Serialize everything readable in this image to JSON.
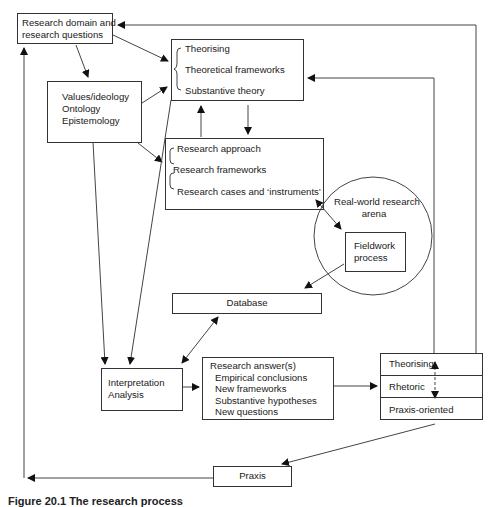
{
  "diagram": {
    "nodes": {
      "research_domain": {
        "lines": [
          "Research domain and",
          "research questions"
        ]
      },
      "values": {
        "lines": [
          "Values/ideology",
          "Ontology",
          "Epistemology"
        ]
      },
      "theory": {
        "lines": [
          "Theorising",
          "Theoretical frameworks",
          "Substantive theory"
        ]
      },
      "approach": {
        "lines": [
          "Research approach",
          "Research frameworks",
          "Research cases and ‘instruments’"
        ]
      },
      "arena": {
        "lines": [
          "Real-world research",
          "arena"
        ]
      },
      "fieldwork": {
        "lines": [
          "Fieldwork",
          "process"
        ]
      },
      "database": {
        "label": "Database"
      },
      "interpretation": {
        "lines": [
          "Interpretation",
          "Analysis"
        ]
      },
      "answers": {
        "title": "Research answer(s)",
        "items": [
          "Empirical conclusions",
          "New frameworks",
          "Substantive hypotheses",
          "New questions"
        ]
      },
      "outputs": {
        "rows": [
          "Theorising",
          "Rhetoric",
          "Praxis-oriented"
        ]
      },
      "praxis": {
        "label": "Praxis"
      }
    },
    "caption": "Figure 20.1  The research process"
  }
}
